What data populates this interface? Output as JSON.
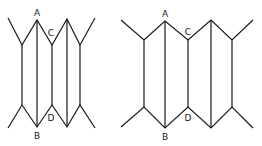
{
  "figures": [
    {
      "name": "left-figure",
      "labels": {
        "A": "A",
        "B": "B",
        "C": "C",
        "D": "D"
      }
    },
    {
      "name": "right-figure",
      "labels": {
        "A": "A",
        "B": "B",
        "C": "C",
        "D": "D"
      }
    }
  ],
  "colors": {
    "stroke": "#1a1a1a",
    "background": "#ffffff"
  }
}
